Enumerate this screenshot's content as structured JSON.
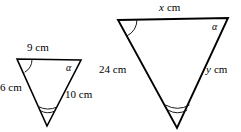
{
  "figure": {
    "background_color": "#ffffff",
    "stroke_color": "#000000"
  },
  "small_triangle": {
    "name": "small-triangle",
    "orientation": "inverted",
    "vertices": {
      "top_left": [
        17,
        59
      ],
      "top_right": [
        81,
        60
      ],
      "bottom": [
        47,
        126
      ]
    },
    "sides": {
      "top": "9 cm",
      "left": "6 cm",
      "right": "10 cm"
    },
    "angles": {
      "top_left_marks": 1,
      "top_right_label": "α",
      "bottom_marks": 2
    }
  },
  "large_triangle": {
    "name": "large-triangle",
    "orientation": "inverted",
    "vertices": {
      "top_left": [
        118,
        20
      ],
      "top_right": [
        228,
        18
      ],
      "bottom": [
        177,
        128
      ]
    },
    "sides": {
      "top_value": "x",
      "top_unit": "cm",
      "left": "24 cm",
      "right_value": "y",
      "right_unit": "cm"
    },
    "angles": {
      "top_left_marks": 1,
      "top_right_label": "α",
      "bottom_marks": 2
    }
  }
}
